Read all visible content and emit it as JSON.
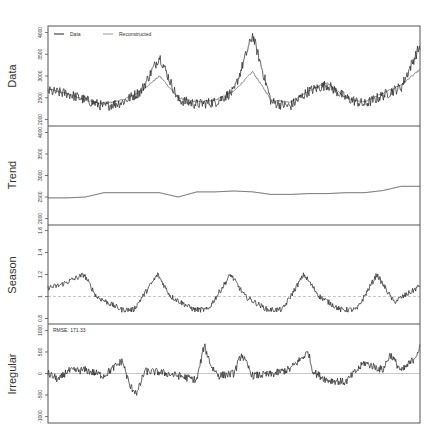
{
  "chart_data": [
    {
      "type": "line",
      "panel": "Data",
      "ylabel": "Data",
      "yticks": [
        2000,
        2500,
        3000,
        3500,
        4000
      ],
      "ylim": [
        1850,
        4150
      ],
      "legend": {
        "position": "top-left",
        "entries": [
          {
            "name": "Data",
            "color": "#222222"
          },
          {
            "name": "Reconstructed",
            "color": "#888888"
          }
        ]
      },
      "series": [
        {
          "name": "Data",
          "description": "Noisy series with seasonal peaks ~3300-3900 and troughs ~2200-2400",
          "x": [
            0,
            5,
            10,
            15,
            20,
            25,
            30,
            35,
            40,
            45,
            50,
            55,
            60,
            65,
            70,
            75,
            80,
            85,
            90,
            95,
            100
          ],
          "values": [
            2650,
            2600,
            2450,
            2300,
            2400,
            2650,
            3450,
            2450,
            2350,
            2400,
            2650,
            3950,
            2400,
            2300,
            2650,
            2800,
            2500,
            2350,
            2550,
            2750,
            3700
          ]
        },
        {
          "name": "Reconstructed",
          "description": "Smooth fitted series",
          "x": [
            0,
            5,
            10,
            15,
            20,
            25,
            30,
            35,
            40,
            45,
            50,
            55,
            60,
            65,
            70,
            75,
            80,
            85,
            90,
            95,
            100
          ],
          "values": [
            2700,
            2600,
            2450,
            2350,
            2450,
            2650,
            3000,
            2500,
            2400,
            2450,
            2650,
            3100,
            2450,
            2400,
            2650,
            2850,
            2500,
            2400,
            2600,
            2800,
            3150
          ]
        }
      ]
    },
    {
      "type": "line",
      "panel": "Trend",
      "ylabel": "Trend",
      "yticks": [
        2000,
        2500,
        3000,
        3500,
        4000
      ],
      "ylim": [
        1850,
        4150
      ],
      "series": [
        {
          "name": "Trend",
          "x": [
            0,
            5,
            10,
            15,
            20,
            25,
            30,
            35,
            40,
            45,
            50,
            55,
            60,
            65,
            70,
            75,
            80,
            85,
            90,
            95,
            100
          ],
          "values": [
            2480,
            2480,
            2500,
            2600,
            2600,
            2600,
            2600,
            2500,
            2620,
            2620,
            2640,
            2620,
            2560,
            2560,
            2580,
            2580,
            2600,
            2600,
            2650,
            2750,
            2750
          ]
        }
      ]
    },
    {
      "type": "line",
      "panel": "Season",
      "ylabel": "Season",
      "yticks": [
        0.8,
        1.0,
        1.2,
        1.4,
        1.6
      ],
      "ylim": [
        0.75,
        1.65
      ],
      "reference_line": {
        "y": 1.0,
        "style": "dashed",
        "color": "#bbbbbb"
      },
      "series": [
        {
          "name": "Season",
          "period_fraction": 0.198,
          "x": [
            0,
            3,
            9.7,
            13,
            19.8,
            23,
            29.5,
            33,
            39.3,
            43,
            49.1,
            53,
            59,
            63,
            68.8,
            73,
            78.6,
            83,
            88.4,
            93,
            98,
            100
          ],
          "values": [
            1.08,
            1.1,
            1.2,
            1.0,
            0.88,
            0.88,
            1.2,
            1.0,
            0.88,
            0.88,
            1.2,
            1.0,
            0.88,
            0.88,
            1.2,
            1.0,
            0.88,
            0.88,
            1.2,
            0.95,
            1.05,
            1.1
          ]
        }
      ]
    },
    {
      "type": "line",
      "panel": "Irregular",
      "ylabel": "Irregular",
      "yticks": [
        -1000,
        -500,
        0,
        500,
        1000
      ],
      "ylim": [
        -1150,
        1150
      ],
      "reference_line": {
        "y": 0,
        "style": "solid",
        "color": "#bbbbbb"
      },
      "annotation": "RMSE: 171.33",
      "series": [
        {
          "name": "Irregular",
          "x": [
            0,
            3,
            5,
            10,
            15,
            20,
            22,
            24,
            26,
            30,
            35,
            40,
            42,
            44,
            46,
            50,
            52,
            55,
            60,
            65,
            70,
            71,
            72,
            75,
            80,
            85,
            90,
            92,
            95,
            98,
            100
          ],
          "values": [
            0,
            -150,
            50,
            80,
            -50,
            300,
            -300,
            -450,
            50,
            30,
            -50,
            -150,
            650,
            150,
            -50,
            0,
            450,
            -50,
            -20,
            100,
            500,
            100,
            0,
            -150,
            -200,
            250,
            80,
            450,
            50,
            300,
            600
          ]
        }
      ]
    }
  ],
  "labels": {
    "data": "Data",
    "trend": "Trend",
    "season": "Season",
    "irregular": "Irregular",
    "legend_data": "Data",
    "legend_reconstructed": "Reconstructed",
    "rmse": "RMSE: 171.33"
  }
}
